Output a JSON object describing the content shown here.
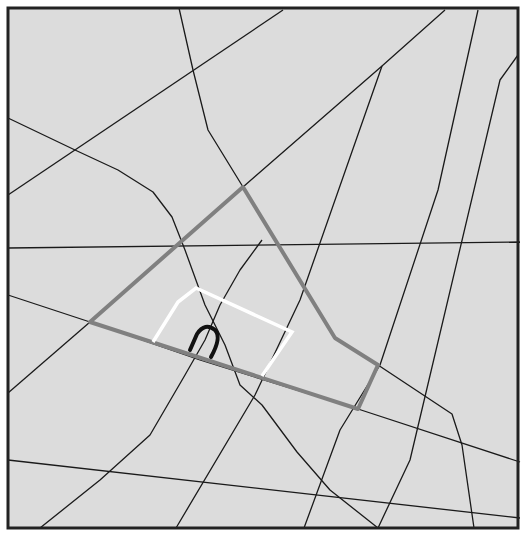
{
  "canvas": {
    "width": 525,
    "height": 540
  },
  "frame": {
    "x": 8,
    "y": 8,
    "width": 510,
    "height": 520,
    "fill": "#dcdcdc",
    "stroke": "#222222",
    "stroke_width": 3
  },
  "colors": {
    "road": "#1a1a1a",
    "route": "#808080",
    "highlight": "#ffffff",
    "marker": "#111111",
    "background": "#dcdcdc"
  },
  "roads": [
    {
      "id": "road-1",
      "points": "179,8 193,70 208,130 243,187"
    },
    {
      "id": "road-2",
      "points": "8,195 283,10"
    },
    {
      "id": "road-3",
      "points": "8,118 75,150 118,170 153,192 172,217 185,250 205,305 225,345 240,385 262,405 297,452 330,490 378,528"
    },
    {
      "id": "road-4",
      "points": "8,248 520,242"
    },
    {
      "id": "road-5",
      "points": "243,187 382,66 445,10"
    },
    {
      "id": "road-6",
      "points": "176,528 255,395 300,300 382,66"
    },
    {
      "id": "road-7",
      "points": "304,528 340,430 380,365 438,190 478,10"
    },
    {
      "id": "road-8",
      "points": "8,295 90,322"
    },
    {
      "id": "road-9",
      "points": "8,393 90,322"
    },
    {
      "id": "road-10",
      "points": "90,322 200,360 358,409 520,462"
    },
    {
      "id": "road-11",
      "points": "378,528 410,460 500,80 518,55"
    },
    {
      "id": "road-12",
      "points": "378,365 452,414 462,445 474,528"
    },
    {
      "id": "road-13",
      "points": "8,460 520,518"
    },
    {
      "id": "road-14",
      "points": "40,528 100,480 150,435 185,375 205,340 220,305 240,270 262,240"
    },
    {
      "id": "road-15",
      "points": "8,180 8,180"
    }
  ],
  "route": {
    "label": "highlighted-route",
    "points": "90,322 243,187 335,338 378,365 358,409 90,322"
  },
  "area": {
    "label": "highlighted-area",
    "points": "153,342 178,302 196,288 292,332 262,376"
  },
  "marker": {
    "label": "location-marker",
    "glyph": "∩",
    "path": "M190,350 L197,334 Q205,322 215,330 Q222,337 211,357"
  }
}
